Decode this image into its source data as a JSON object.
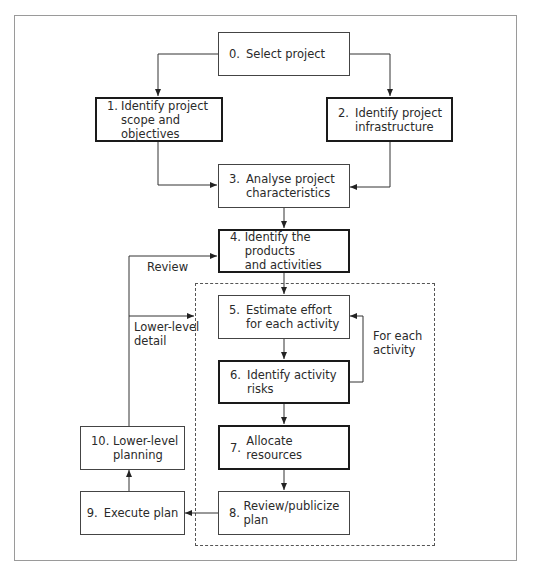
{
  "diagram": {
    "type": "flowchart",
    "nodes": [
      {
        "id": "0",
        "num": "0.",
        "label": "Select project",
        "emphasis": false
      },
      {
        "id": "1",
        "num": "1.",
        "label_line1": "Identify project",
        "label_line2": "scope and objectives",
        "emphasis": true
      },
      {
        "id": "2",
        "num": "2.",
        "label_line1": "Identify project",
        "label_line2": "infrastructure",
        "emphasis": true
      },
      {
        "id": "3",
        "num": "3.",
        "label_line1": "Analyse project",
        "label_line2": "characteristics",
        "emphasis": false
      },
      {
        "id": "4",
        "num": "4.",
        "label_line1": "Identify the products",
        "label_line2": "and activities",
        "emphasis": true
      },
      {
        "id": "5",
        "num": "5.",
        "label_line1": "Estimate effort",
        "label_line2": "for each activity",
        "emphasis": false
      },
      {
        "id": "6",
        "num": "6.",
        "label_line1": "Identify activity",
        "label_line2": "risks",
        "emphasis": true
      },
      {
        "id": "7",
        "num": "7.",
        "label": "Allocate resources",
        "emphasis": true
      },
      {
        "id": "8",
        "num": "8.",
        "label": "Review/publicize plan",
        "emphasis": false
      },
      {
        "id": "9",
        "num": "9.",
        "label": "Execute plan",
        "emphasis": false
      },
      {
        "id": "10",
        "num": "10.",
        "label_line1": "Lower-level",
        "label_line2": "planning",
        "emphasis": false
      }
    ],
    "edge_labels": {
      "review": "Review",
      "lower_level_line1": "Lower-level",
      "lower_level_line2": "detail",
      "for_each_line1": "For each",
      "for_each_line2": "activity"
    },
    "edges": [
      {
        "from": "0",
        "to": "1"
      },
      {
        "from": "0",
        "to": "2"
      },
      {
        "from": "1",
        "to": "3"
      },
      {
        "from": "2",
        "to": "3"
      },
      {
        "from": "3",
        "to": "4"
      },
      {
        "from": "4",
        "to": "5"
      },
      {
        "from": "5",
        "to": "6"
      },
      {
        "from": "6",
        "to": "5",
        "label": "For each activity"
      },
      {
        "from": "6",
        "to": "7"
      },
      {
        "from": "7",
        "to": "8"
      },
      {
        "from": "8",
        "to": "9"
      },
      {
        "from": "9",
        "to": "10"
      },
      {
        "from": "10",
        "to": "4",
        "label": "Review"
      },
      {
        "from": "10",
        "to": "group-5-8",
        "label": "Lower-level detail"
      }
    ],
    "groups": [
      {
        "id": "group-5-8",
        "members": [
          "5",
          "6",
          "7",
          "8"
        ],
        "style": "dashed"
      }
    ]
  }
}
